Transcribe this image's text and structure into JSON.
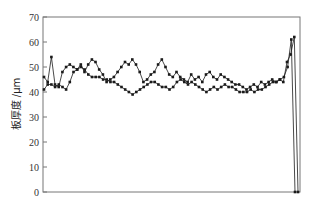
{
  "chart_data": {
    "type": "line",
    "title": "",
    "xlabel": "",
    "ylabel": "板厚度 /μm",
    "ylim": [
      0,
      70
    ],
    "yticks": [
      0,
      10,
      20,
      30,
      40,
      50,
      60,
      70
    ],
    "xticks": [],
    "grid": false,
    "legend": null,
    "line_color": "#1a1a1a",
    "frame_color": "#777777",
    "series": [
      {
        "name": "series-1",
        "marker": "square",
        "values": [
          41,
          43,
          43,
          42,
          43,
          42,
          41,
          44,
          48,
          49,
          50,
          49,
          47,
          46,
          46,
          46,
          45,
          45,
          44,
          44,
          43,
          42,
          41,
          40,
          39,
          40,
          41,
          42,
          43,
          44,
          44,
          43,
          42,
          42,
          41,
          42,
          44,
          45,
          44,
          43,
          44,
          43,
          42,
          41,
          40,
          41,
          42,
          41,
          42,
          43,
          42,
          42,
          41,
          40,
          40,
          40,
          41,
          40,
          41,
          41,
          42,
          43,
          44,
          44,
          45,
          46,
          50,
          61,
          0
        ]
      },
      {
        "name": "series-2",
        "marker": "square",
        "values": [
          46,
          44,
          54,
          43,
          42,
          48,
          50,
          51,
          50,
          49,
          51,
          48,
          51,
          53,
          52,
          49,
          47,
          44,
          45,
          46,
          48,
          50,
          52,
          51,
          53,
          51,
          48,
          44,
          45,
          47,
          48,
          51,
          53,
          50,
          47,
          46,
          48,
          46,
          45,
          44,
          47,
          45,
          46,
          44,
          47,
          48,
          46,
          45,
          47,
          46,
          45,
          44,
          43,
          43,
          42,
          41,
          42,
          43,
          42,
          44,
          43,
          44,
          45,
          44,
          45,
          44,
          52,
          55,
          62,
          0
        ]
      }
    ]
  }
}
